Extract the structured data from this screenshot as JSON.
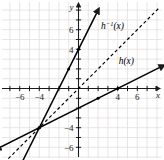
{
  "figure": {
    "width": 164,
    "height": 160,
    "background_color": "#ffffff",
    "grid_color": "#e2dede",
    "axis_color": "#1a1a1a",
    "curve_color": "#000000"
  },
  "axes": {
    "x_axis_name": "x",
    "y_axis_name": "y",
    "x_ticks": [
      {
        "value": -6,
        "label": "−6"
      },
      {
        "value": -4,
        "label": "−4"
      },
      {
        "value": 4,
        "label": "4"
      },
      {
        "value": 6,
        "label": "6"
      }
    ],
    "y_ticks": [
      {
        "value": 6,
        "label": "6"
      },
      {
        "value": 4,
        "label": "4"
      },
      {
        "value": -4,
        "label": "−4"
      },
      {
        "value": -6,
        "label": "−6"
      }
    ],
    "grid": "on",
    "grid_step": 1
  },
  "chart_data": {
    "type": "line",
    "title": "",
    "xlabel": "x",
    "ylabel": "y",
    "xlim": [
      -8,
      8.8
    ],
    "ylim": [
      -8.2,
      8
    ],
    "grid": true,
    "grid_step": 1,
    "legend": "inline-labels",
    "series": [
      {
        "name": "h(x)",
        "label": "h(x)",
        "label_base": "h",
        "label_sup": "",
        "label_arg": "(x)",
        "style": "solid",
        "slope": 0.5,
        "intercept": -2,
        "equation": "y = 0.5x - 2",
        "x": [
          -8,
          8.3
        ],
        "y": [
          -6,
          2.15
        ],
        "arrows": [
          "start",
          "end"
        ],
        "label_position": {
          "x": 4.1,
          "y": 2.55
        },
        "points": [
          {
            "x": -4,
            "y": -4
          },
          {
            "x": 2,
            "y": -1
          },
          {
            "x": 4,
            "y": 0
          }
        ]
      },
      {
        "name": "h^{-1}(x)",
        "label": "h⁻¹(x)",
        "label_base": "h",
        "label_sup": "−1",
        "label_arg": "(x)",
        "style": "solid",
        "slope": 2,
        "intercept": 4,
        "equation": "y = 2x + 4",
        "x": [
          -6.1,
          1.85
        ],
        "y": [
          -8.2,
          7.7
        ],
        "arrows": [
          "start",
          "end"
        ],
        "label_position": {
          "x": 2.3,
          "y": 6.1
        },
        "points": [
          {
            "x": -4,
            "y": -4
          },
          {
            "x": -1,
            "y": 2
          },
          {
            "x": 0,
            "y": 4
          }
        ]
      },
      {
        "name": "y = x",
        "label": "",
        "label_base": "",
        "label_sup": "",
        "label_arg": "",
        "style": "dashed",
        "slope": 1,
        "intercept": 0,
        "equation": "y = x",
        "x": [
          -8,
          8.3
        ],
        "y": [
          -8,
          8.3
        ],
        "arrows": [],
        "label_position": null,
        "points": []
      }
    ],
    "annotations": [
      {
        "text": "intersection of h(x), h^{-1}(x) and y = x",
        "x": -4,
        "y": -4
      }
    ]
  }
}
